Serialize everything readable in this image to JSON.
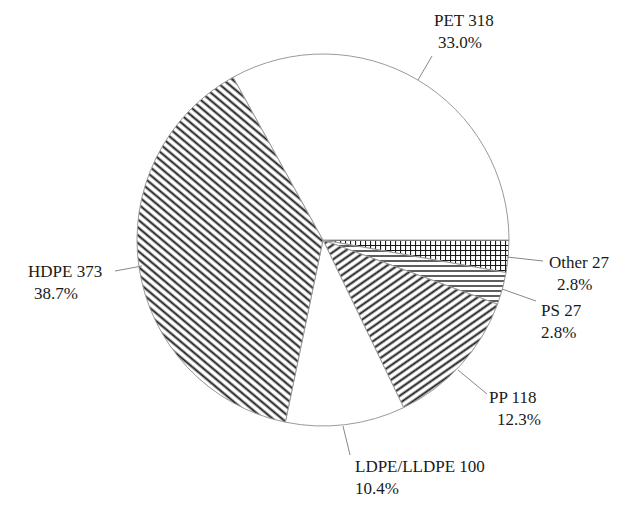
{
  "chart_data": {
    "type": "pie",
    "title": "",
    "start_angle_deg": 0,
    "direction": "clockwise",
    "slices": [
      {
        "label": "Other",
        "value": 27,
        "percent": "2.8%",
        "pattern": "grid"
      },
      {
        "label": "PS",
        "value": 27,
        "percent": "2.8%",
        "pattern": "horizontal"
      },
      {
        "label": "PP",
        "value": 118,
        "percent": "12.3%",
        "pattern": "diag-up"
      },
      {
        "label": "LDPE/LLDPE",
        "value": 100,
        "percent": "10.4%",
        "pattern": "none"
      },
      {
        "label": "HDPE",
        "value": 373,
        "percent": "38.7%",
        "pattern": "diag-down"
      },
      {
        "label": "PET",
        "value": 318,
        "percent": "33.0%",
        "pattern": "none"
      }
    ],
    "total": 963
  },
  "labels": {
    "pet": {
      "name": "PET 318",
      "pct": "33.0%"
    },
    "hdpe": {
      "name": "HDPE 373",
      "pct": "38.7%"
    },
    "ldpe": {
      "name": "LDPE/LLDPE 100",
      "pct": "10.4%"
    },
    "pp": {
      "name": "PP 118",
      "pct": "12.3%"
    },
    "ps": {
      "name": "PS 27",
      "pct": "2.8%"
    },
    "other": {
      "name": "Other 27",
      "pct": "2.8%"
    }
  },
  "colors": {
    "stroke": "#888888",
    "hatch": "#1a1a1a",
    "fill": "#ffffff"
  }
}
